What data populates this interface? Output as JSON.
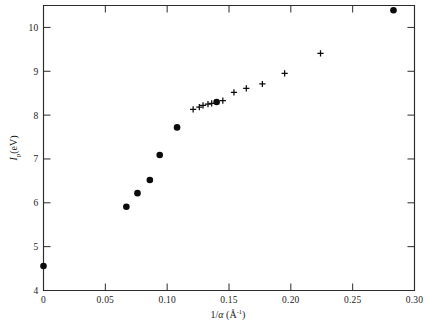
{
  "figure": {
    "name": "ionization-potential-vs-inverse-alpha-plot",
    "background_color": "#ffffff",
    "ink_color": "#0b0b0b"
  },
  "chart_data": {
    "type": "scatter",
    "title": "",
    "xlabel": "1/α (Å⁻¹)",
    "ylabel": "Iₚ(eV)",
    "xlabel_parts": {
      "prefix": "1/",
      "symbol": "α",
      "open_paren": " (",
      "unit": "Å",
      "exponent": "-1",
      "close_paren": ")"
    },
    "ylabel_parts": {
      "symbol": "I",
      "subscript": "p",
      "unit": "(eV)"
    },
    "xlim": [
      0,
      0.3
    ],
    "ylim": [
      4,
      10.5
    ],
    "xticks": [
      0,
      0.05,
      0.1,
      0.15,
      0.2,
      0.25,
      0.3
    ],
    "xtick_labels": [
      "0",
      "0.05",
      "0.10",
      "0.15",
      "0.20",
      "0.25",
      "0.30"
    ],
    "yticks": [
      4,
      5,
      6,
      7,
      8,
      9,
      10
    ],
    "ytick_labels": [
      "4",
      "5",
      "6",
      "7",
      "8",
      "9",
      "10"
    ],
    "grid": false,
    "legend": false,
    "legend_position": "none",
    "series": [
      {
        "name": "filled-circle-series",
        "marker": "filled-circle",
        "color": "#0b0b0b",
        "points": [
          {
            "x": 0.0,
            "y": 4.56
          },
          {
            "x": 0.067,
            "y": 5.91
          },
          {
            "x": 0.076,
            "y": 6.22
          },
          {
            "x": 0.086,
            "y": 6.52
          },
          {
            "x": 0.094,
            "y": 7.09
          },
          {
            "x": 0.108,
            "y": 7.72
          },
          {
            "x": 0.14,
            "y": 8.3
          },
          {
            "x": 0.283,
            "y": 10.39
          }
        ]
      },
      {
        "name": "plus-marker-series",
        "marker": "plus",
        "color": "#0b0b0b",
        "points": [
          {
            "x": 0.121,
            "y": 8.13
          },
          {
            "x": 0.126,
            "y": 8.18
          },
          {
            "x": 0.129,
            "y": 8.22
          },
          {
            "x": 0.133,
            "y": 8.25
          },
          {
            "x": 0.136,
            "y": 8.27
          },
          {
            "x": 0.145,
            "y": 8.33
          },
          {
            "x": 0.154,
            "y": 8.52
          },
          {
            "x": 0.164,
            "y": 8.61
          },
          {
            "x": 0.177,
            "y": 8.71
          },
          {
            "x": 0.195,
            "y": 8.95
          },
          {
            "x": 0.224,
            "y": 9.41
          }
        ]
      }
    ]
  }
}
